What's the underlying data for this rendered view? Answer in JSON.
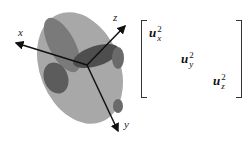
{
  "figure": {
    "type": "ellipsoid-tensor-diagram",
    "axes": [
      {
        "label": "x"
      },
      {
        "label": "y"
      },
      {
        "label": "z"
      }
    ],
    "colors": {
      "ellipsoid_light": "#a8a8a8",
      "ellipsoid_mid": "#7a7a7a",
      "ellipsoid_dark": "#4e4e4e",
      "axis": "#111111"
    }
  },
  "matrix": {
    "entries": [
      {
        "base": "u",
        "sup": "2",
        "sub": "x"
      },
      {
        "base": "u",
        "sup": "2",
        "sub": "y"
      },
      {
        "base": "u",
        "sup": "2",
        "sub": "z"
      }
    ]
  }
}
